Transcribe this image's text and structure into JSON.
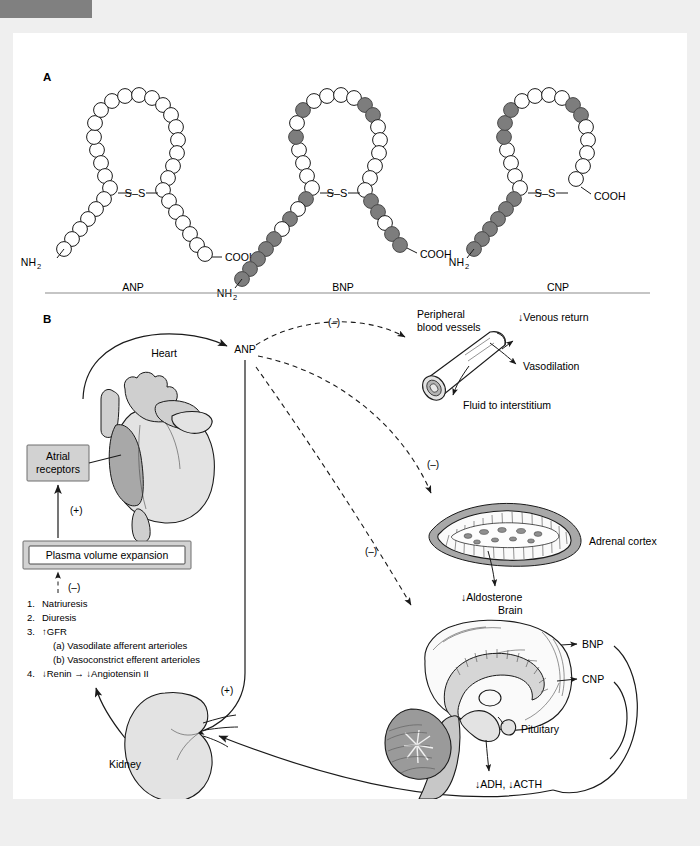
{
  "figure": {
    "panel_a": {
      "letter": "A",
      "peptides": [
        {
          "name": "ANP",
          "n_terminus": "NH",
          "n_terminus_sub": "2",
          "c_terminus": "COOH",
          "disulfide": "S–S",
          "bead_pattern": "all residues unshaded (open circles)"
        },
        {
          "name": "BNP",
          "n_terminus": "NH",
          "n_terminus_sub": "2",
          "c_terminus": "COOH",
          "disulfide": "S–S",
          "bead_pattern": "mixed shaded and unshaded residues; long shaded N-terminal tail"
        },
        {
          "name": "CNP",
          "n_terminus": "NH",
          "n_terminus_sub": "2",
          "c_terminus": "COOH",
          "disulfide": "S–S",
          "bead_pattern": "shaded N-terminal tail and upper-left ring residues; short C-terminal"
        }
      ]
    },
    "panel_b": {
      "letter": "B",
      "nodes": {
        "heart": "Heart",
        "anp": "ANP",
        "atrial_receptors_line1": "Atrial",
        "atrial_receptors_line2": "receptors",
        "plasma_volume": "Plasma volume expansion",
        "peripheral_vessels_line1": "Peripheral",
        "peripheral_vessels_line2": "blood vessels",
        "adrenal_cortex": "Adrenal cortex",
        "brain": "Brain",
        "pituitary": "Pituitary",
        "kidney": "Kidney"
      },
      "effects": {
        "venous_return": "↓Venous return",
        "vasodilation": "Vasodilation",
        "fluid_to_interstitium": "Fluid to interstitium",
        "aldosterone": "↓Aldosterone",
        "adh_acth": "↓ADH, ↓ACTH",
        "bnp": "BNP",
        "cnp": "CNP"
      },
      "signs": {
        "plus_receptors": "(+)",
        "minus_plasma": "(–)",
        "minus_vessels": "(–)",
        "minus_adrenal": "(–)",
        "minus_brain": "(–)",
        "plus_kidney": "(+)"
      },
      "renal_effects": [
        {
          "number": "1.",
          "text": "Natriuresis",
          "indent": 0
        },
        {
          "number": "2.",
          "text": "Diuresis",
          "indent": 0
        },
        {
          "number": "3.",
          "text": "↑GFR",
          "indent": 0
        },
        {
          "number": "",
          "text": "(a) Vasodilate afferent arterioles",
          "indent": 1
        },
        {
          "number": "",
          "text": "(b) Vasoconstrict efferent arterioles",
          "indent": 1
        },
        {
          "number": "4.",
          "text": "↓Renin → ↓Angiotensin II",
          "indent": 0
        }
      ]
    },
    "colors": {
      "page_background": "#efefef",
      "sheet_background": "#ffffff",
      "corner_tab": "#808080",
      "bead_shaded": "#7d7d7d",
      "bead_open": "#ffffff",
      "box_fill": "#d2d2d2",
      "line": "#1a1a1a",
      "divider": "#8c8c8c"
    }
  }
}
